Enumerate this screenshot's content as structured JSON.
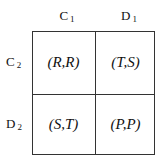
{
  "columns": [
    {
      "letter": "C",
      "sub": "1"
    },
    {
      "letter": "D",
      "sub": "1"
    }
  ],
  "rows": [
    {
      "letter": "C",
      "sub": "2"
    },
    {
      "letter": "D",
      "sub": "2"
    }
  ],
  "cells": [
    [
      "(R,R)",
      "(T,S)"
    ],
    [
      "(S,T)",
      "(P,P)"
    ]
  ]
}
